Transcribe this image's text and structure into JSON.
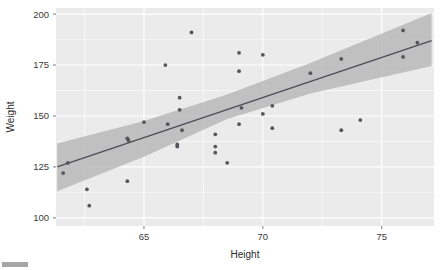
{
  "chart_data": {
    "type": "scatter",
    "title": "",
    "subtitle": "",
    "xlabel": "Height",
    "ylabel": "Weight",
    "xlim": [
      61.3,
      77.2
    ],
    "ylim": [
      96,
      203
    ],
    "xticks": [
      65,
      70,
      75
    ],
    "yticks": [
      100,
      125,
      150,
      175,
      200
    ],
    "xtick_labels": [
      "65",
      "70",
      "75"
    ],
    "ytick_labels": [
      "100",
      "125",
      "150",
      "175",
      "200"
    ],
    "grid": true,
    "legend": null,
    "legend_position": "none",
    "panel_background": "#ebebeb",
    "gridline_color": "#ffffff",
    "point_color": "#55555c",
    "line_color": "#4d4d55",
    "ribbon_color": "#b9b9b9",
    "point_count": 40,
    "points": [
      {
        "x": 61.6,
        "y": 122
      },
      {
        "x": 61.8,
        "y": 127
      },
      {
        "x": 62.6,
        "y": 114
      },
      {
        "x": 62.7,
        "y": 106
      },
      {
        "x": 64.3,
        "y": 139
      },
      {
        "x": 64.35,
        "y": 138
      },
      {
        "x": 64.3,
        "y": 118
      },
      {
        "x": 65.0,
        "y": 147
      },
      {
        "x": 66.0,
        "y": 146
      },
      {
        "x": 65.9,
        "y": 175
      },
      {
        "x": 66.5,
        "y": 159
      },
      {
        "x": 66.5,
        "y": 153
      },
      {
        "x": 66.6,
        "y": 143
      },
      {
        "x": 66.4,
        "y": 136
      },
      {
        "x": 66.4,
        "y": 135
      },
      {
        "x": 67.0,
        "y": 191
      },
      {
        "x": 68.0,
        "y": 141
      },
      {
        "x": 68.0,
        "y": 135
      },
      {
        "x": 68.0,
        "y": 132
      },
      {
        "x": 68.5,
        "y": 127
      },
      {
        "x": 69.0,
        "y": 181
      },
      {
        "x": 69.0,
        "y": 172
      },
      {
        "x": 69.1,
        "y": 154
      },
      {
        "x": 69.0,
        "y": 146
      },
      {
        "x": 70.0,
        "y": 180
      },
      {
        "x": 70.0,
        "y": 151
      },
      {
        "x": 70.4,
        "y": 155
      },
      {
        "x": 70.4,
        "y": 144
      },
      {
        "x": 72.0,
        "y": 171
      },
      {
        "x": 73.3,
        "y": 178
      },
      {
        "x": 73.3,
        "y": 143
      },
      {
        "x": 74.1,
        "y": 148
      },
      {
        "x": 75.9,
        "y": 192
      },
      {
        "x": 75.9,
        "y": 179
      },
      {
        "x": 76.5,
        "y": 186
      }
    ],
    "fit_line": {
      "name": "linear regression fit",
      "x_start": 61.35,
      "y_start": 125.0,
      "x_end": 77.1,
      "y_end": 187.0
    },
    "confidence_band": {
      "name": "95% confidence interval",
      "upper": [
        {
          "x": 61.35,
          "y": 136.5
        },
        {
          "x": 65.0,
          "y": 147.5
        },
        {
          "x": 68.5,
          "y": 160.5
        },
        {
          "x": 72.0,
          "y": 176.0
        },
        {
          "x": 77.1,
          "y": 200.5
        }
      ],
      "lower": [
        {
          "x": 61.35,
          "y": 113.0
        },
        {
          "x": 65.0,
          "y": 130.0
        },
        {
          "x": 68.5,
          "y": 148.5
        },
        {
          "x": 72.0,
          "y": 161.0
        },
        {
          "x": 77.1,
          "y": 174.5
        }
      ]
    }
  },
  "axes": {
    "x_title": "Height",
    "y_title": "Weight"
  }
}
